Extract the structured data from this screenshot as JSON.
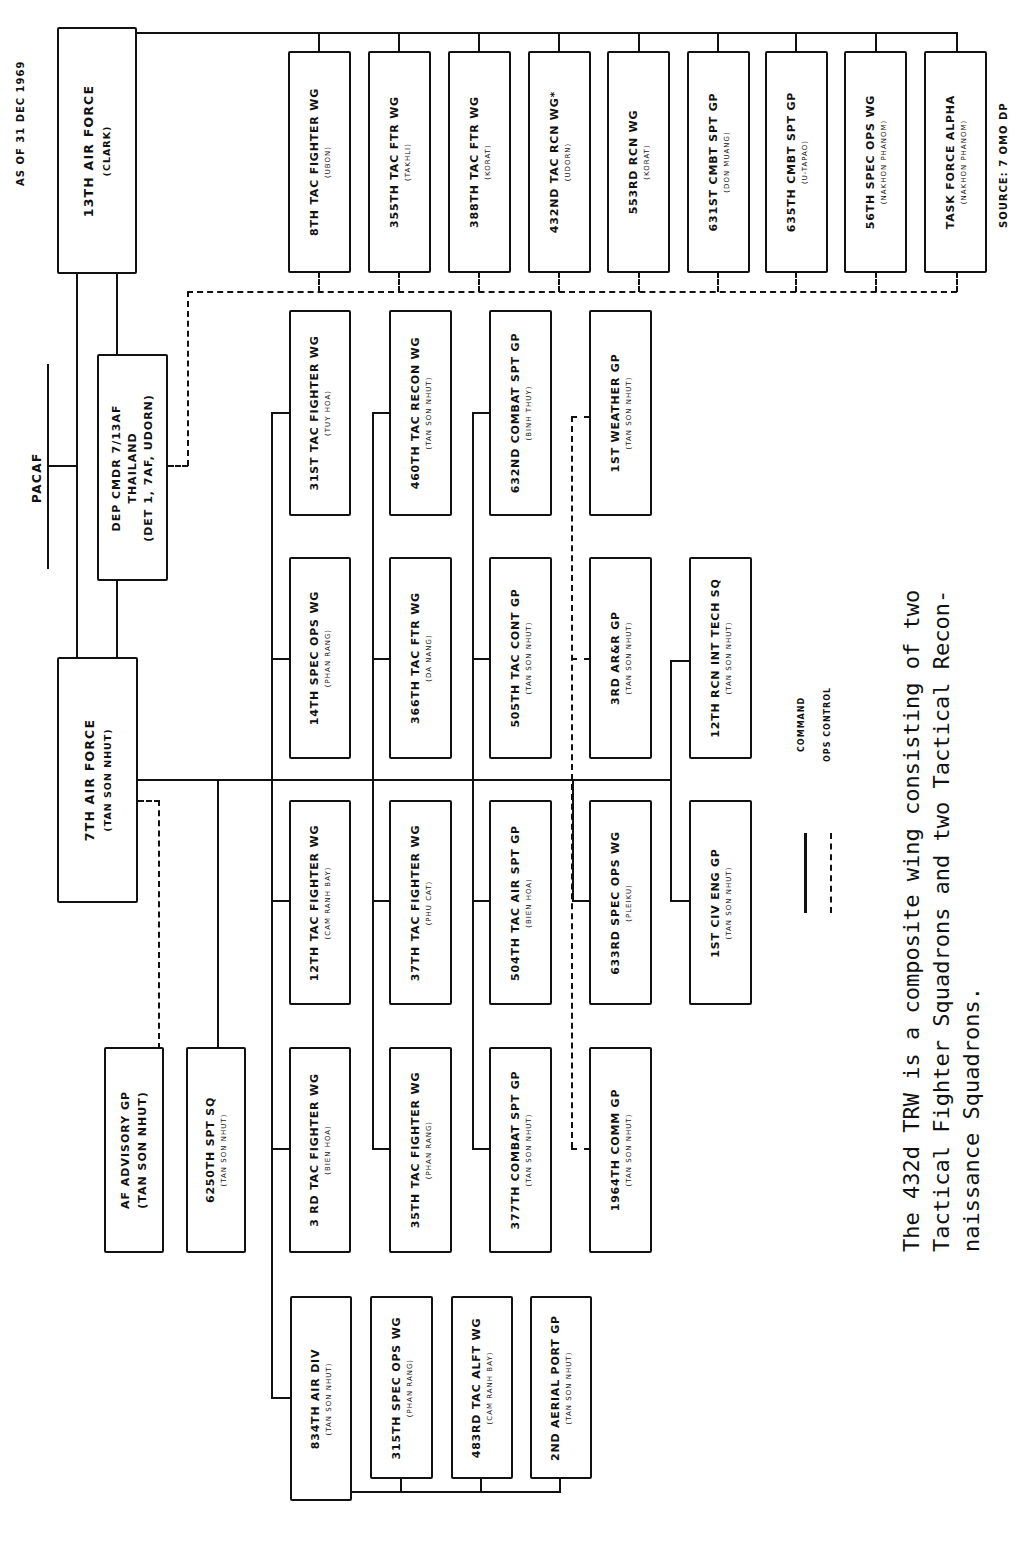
{
  "header": {
    "as_of": "AS OF  31 DEC 1969",
    "source": "SOURCE: 7 OMO DP",
    "pacaf": "PACAF"
  },
  "hq": {
    "thirteenth_af": {
      "name": "13TH AIR FORCE",
      "location": "(CLARK)"
    },
    "dep_cmdr": {
      "line1": "DEP CMDR 7/13AF",
      "line2": "THAILAND",
      "line3": "(DET 1, 7AF, UDORN)"
    },
    "seventh_af": {
      "name": "7TH AIR FORCE",
      "location": "(TAN SON NHUT)"
    }
  },
  "thailand_units": [
    {
      "name": "8TH TAC FIGHTER WG",
      "location": "(UBON)"
    },
    {
      "name": "355TH TAC FTR WG",
      "location": "(TAKHLI)"
    },
    {
      "name": "388TH TAC FTR WG",
      "location": "(KORAT)"
    },
    {
      "name": "432ND TAC RCN WG*",
      "location": "(UDORN)"
    },
    {
      "name": "553RD RCN WG",
      "location": "(KORAT)"
    },
    {
      "name": "631ST CMBT SPT GP",
      "location": "(DON MUANG)"
    },
    {
      "name": "635TH CMBT SPT GP",
      "location": "(U-TAPAO)"
    },
    {
      "name": "56TH SPEC OPS WG",
      "location": "(NAKHON PHANOM)"
    },
    {
      "name": "TASK FORCE ALPHA",
      "location": "(NAKHON PHANOM)"
    }
  ],
  "vietnam_units": {
    "col_a": [
      {
        "name": "31ST TAC FIGHTER WG",
        "location": "(TUY HOA)"
      },
      {
        "name": "14TH SPEC OPS WG",
        "location": "(PHAN RANG)"
      },
      {
        "name": "12TH TAC FIGHTER WG",
        "location": "(CAM RANH BAY)"
      },
      {
        "name": "3 RD TAC FIGHTER WG",
        "location": "(BIEN HOA)"
      }
    ],
    "col_b": [
      {
        "name": "460TH TAC RECON WG",
        "location": "(TAN SON NHUT)"
      },
      {
        "name": "366TH TAC FTR WG",
        "location": "(DA NANG)"
      },
      {
        "name": "37TH TAC FIGHTER WG",
        "location": "(PHU CAT)"
      },
      {
        "name": "35TH TAC FIGHTER WG",
        "location": "(PHAN RANG)"
      }
    ],
    "col_c": [
      {
        "name": "632ND COMBAT SPT GP",
        "location": "(BINH THUY)"
      },
      {
        "name": "505TH TAC CONT GP",
        "location": "(TAN SON NHUT)"
      },
      {
        "name": "504TH TAC AIR SPT GP",
        "location": "(BIEN HOA)"
      },
      {
        "name": "377TH COMBAT SPT GP",
        "location": "(TAN SON NHUT)"
      }
    ],
    "col_d": [
      {
        "name": "1ST WEATHER GP",
        "location": "(TAN SON NHUT)"
      },
      {
        "name": "3RD AR&R GP",
        "location": "(TAN SON NHUT)"
      },
      {
        "name": "633RD SPEC OPS WG",
        "location": "(PLEIKU)"
      },
      {
        "name": "1964TH COMM GP",
        "location": "(TAN SON NHUT)"
      }
    ],
    "col_e": [
      {
        "name": "12TH RCN INT TECH SQ",
        "location": "(TAN SON NHUT)"
      },
      {
        "name": "1ST CIV ENG GP",
        "location": "(TAN SON NHUT)"
      }
    ],
    "left": [
      {
        "name": "AF ADVISORY GP",
        "location": "(TAN SON NHUT)"
      },
      {
        "name": "6250TH SPT SQ",
        "location": "(TAN SON NHUT)"
      }
    ],
    "air_div": [
      {
        "name": "834TH AIR DIV",
        "location": "(TAN SON NHUT)"
      },
      {
        "name": "315TH SPEC OPS WG",
        "location": "(PHAN RANG)"
      },
      {
        "name": "483RD TAC ALFT WG",
        "location": "(CAM RANH BAY)"
      },
      {
        "name": "2ND AERIAL PORT GP",
        "location": "(TAN SON NHUT)"
      }
    ]
  },
  "legend": {
    "command": "COMMAND",
    "ops_control": "OPS CONTROL"
  },
  "footnote": {
    "line1": "The 432d TRW is a composite wing consisting of two",
    "line2": "Tactical Fighter Squadrons and two Tactical Recon-",
    "line3": "naissance Squadrons."
  }
}
